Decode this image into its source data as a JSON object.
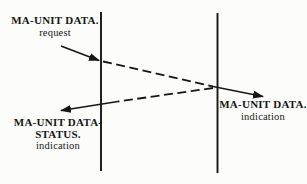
{
  "diagram": {
    "kind": "time-sequence-diagram",
    "colors": {
      "background": "#fcfcfa",
      "ink": "#161616"
    },
    "request": {
      "primitive": "MA-UNIT DATA.",
      "qualifier": "request"
    },
    "status": {
      "primitive_line1": "MA-UNIT DATA-",
      "primitive_line2": "STATUS.",
      "qualifier": "indication"
    },
    "indication": {
      "primitive": "MA-UNIT DATA.",
      "qualifier": "indication"
    }
  }
}
